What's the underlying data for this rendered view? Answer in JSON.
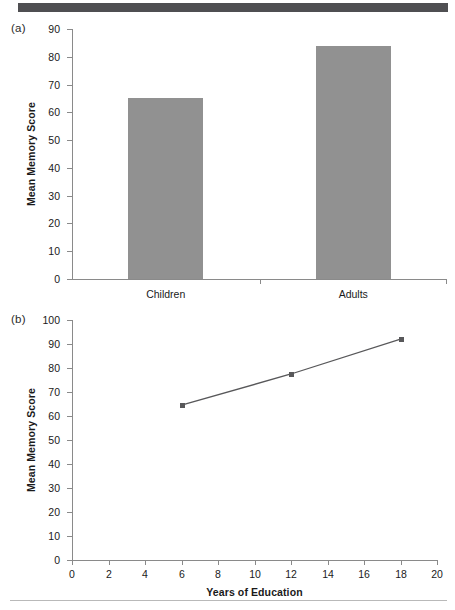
{
  "figure": {
    "panel_a_label": "(a)",
    "panel_b_label": "(b)"
  },
  "chart_data": [
    {
      "type": "bar",
      "panel": "(a)",
      "title": "",
      "xlabel": "",
      "ylabel": "Mean Memory Score",
      "categories": [
        "Children",
        "Adults"
      ],
      "values": [
        65,
        84
      ],
      "ylim": [
        0,
        90
      ],
      "yticks": [
        0,
        10,
        20,
        30,
        40,
        50,
        60,
        70,
        80,
        90
      ],
      "ytick_labels": [
        "0",
        "10",
        "20",
        "30",
        "40",
        "50",
        "60",
        "70",
        "80",
        "90"
      ],
      "grid": false,
      "legend": "none",
      "bar_color": "#919191",
      "axis_color": "#8a8a8a"
    },
    {
      "type": "line",
      "panel": "(b)",
      "title": "",
      "xlabel": "Years of Education",
      "ylabel": "Mean Memory Score",
      "x": [
        6,
        12,
        18
      ],
      "values": [
        64.5,
        77.5,
        92
      ],
      "series": [
        {
          "name": "Mean Memory Score",
          "values": [
            64.5,
            77.5,
            92
          ]
        }
      ],
      "xlim": [
        0,
        20
      ],
      "ylim": [
        0,
        100
      ],
      "xticks": [
        0,
        2,
        4,
        6,
        8,
        10,
        12,
        14,
        16,
        18,
        20
      ],
      "xtick_labels": [
        "0",
        "2",
        "4",
        "6",
        "8",
        "10",
        "12",
        "14",
        "16",
        "18",
        "20"
      ],
      "yticks": [
        0,
        10,
        20,
        30,
        40,
        50,
        60,
        70,
        80,
        90,
        100
      ],
      "ytick_labels": [
        "0",
        "10",
        "20",
        "30",
        "40",
        "50",
        "60",
        "70",
        "80",
        "90",
        "100"
      ],
      "grid": false,
      "legend": "none",
      "marker": "square",
      "line_color": "#58585a",
      "marker_color": "#58585a",
      "axis_color": "#8a8a8a"
    }
  ]
}
